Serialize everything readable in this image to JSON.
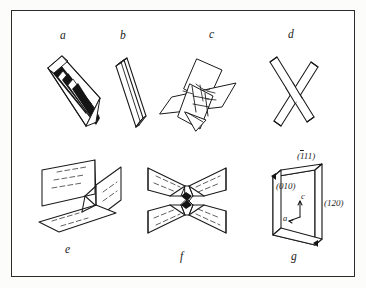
{
  "plate": {
    "title": "crystal twin habit diagrams",
    "background_color": "#ffffff",
    "frame_color": "#2b2b2b",
    "ink_color": "#1a1a1a"
  },
  "figures": [
    {
      "id": "a",
      "label": "a",
      "caption_position": "top",
      "description": "polysynthetic lamellar twin slab with dark stripes"
    },
    {
      "id": "b",
      "label": "b",
      "caption_position": "top",
      "description": "elongated thin lath prism"
    },
    {
      "id": "c",
      "label": "c",
      "caption_position": "top",
      "description": "interpenetrant star-shaped twin of crossing plates"
    },
    {
      "id": "d",
      "label": "d",
      "caption_position": "top",
      "description": "cross-shaped X twin of two crossing laths"
    },
    {
      "id": "e",
      "label": "e",
      "caption_position": "bottom",
      "description": "three intersecting planes with dashed striations"
    },
    {
      "id": "f",
      "label": "f",
      "caption_position": "bottom",
      "description": "fourfold cruciform arrangement of striated plates"
    },
    {
      "id": "g",
      "label": "g",
      "caption_position": "bottom",
      "description": "tabular plate with indexed crystal faces and axes"
    }
  ],
  "figure_g": {
    "faces": [
      {
        "name": "face-1bar11",
        "prefix": "(",
        "bar_digit": "1",
        "rest": "11)"
      },
      {
        "name": "face-010",
        "text": "(010)"
      },
      {
        "name": "face-120",
        "text": "(120)"
      }
    ],
    "axes": [
      {
        "name": "axis-c",
        "text": "c"
      },
      {
        "name": "axis-a",
        "text": "a"
      }
    ]
  }
}
